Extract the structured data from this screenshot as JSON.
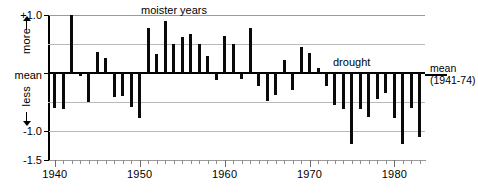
{
  "chart_data": {
    "type": "bar",
    "title": "",
    "subtitle": "",
    "xlabel": "",
    "ylabel": "",
    "xlim": [
      1939.2,
      1983.6
    ],
    "ylim": [
      -1.5,
      1.0
    ],
    "grid": true,
    "gridlines_y": [
      1.0,
      0.5,
      0.0,
      -0.5,
      -1.0,
      -1.5
    ],
    "legend": "none",
    "y_tick_labels": [
      "+1.0",
      "-1.0",
      "-1.5"
    ],
    "y_tick_values": [
      1.0,
      -1.0,
      -1.5
    ],
    "y_zero_label": "mean",
    "y_direction_labels": {
      "up": "more",
      "down": "less"
    },
    "x_tick_labels": [
      "1940",
      "1950",
      "1960",
      "1970",
      "1980"
    ],
    "x_tick_values": [
      1940,
      1950,
      1960,
      1970,
      1980
    ],
    "x_minor_tick_step": 1,
    "annotations": [
      {
        "text": "moister years",
        "x": 1951,
        "y": 1.02
      },
      {
        "text": "drought",
        "x": 1974,
        "y": 0.15
      },
      {
        "text": "mean",
        "x": 1984.5,
        "y": 0.09
      },
      {
        "text": "(1941-74)",
        "x": 1984.5,
        "y": -0.03
      }
    ],
    "bar_color": "#0a0a0a",
    "categories": [
      1940,
      1941,
      1942,
      1943,
      1944,
      1945,
      1946,
      1947,
      1948,
      1949,
      1950,
      1951,
      1952,
      1953,
      1954,
      1955,
      1956,
      1957,
      1958,
      1959,
      1960,
      1961,
      1962,
      1963,
      1964,
      1965,
      1966,
      1967,
      1968,
      1969,
      1970,
      1971,
      1972,
      1973,
      1974,
      1975,
      1976,
      1977,
      1978,
      1979,
      1980,
      1981,
      1982,
      1983
    ],
    "values": [
      -0.6,
      -0.62,
      1.0,
      -0.05,
      -0.5,
      0.36,
      0.26,
      -0.42,
      -0.4,
      -0.58,
      -0.78,
      0.77,
      0.32,
      0.9,
      0.5,
      0.62,
      0.68,
      0.5,
      0.3,
      -0.12,
      0.64,
      0.5,
      -0.1,
      0.78,
      -0.22,
      -0.48,
      -0.38,
      0.22,
      -0.3,
      0.45,
      0.34,
      0.08,
      -0.22,
      -0.56,
      -0.62,
      -1.22,
      -0.62,
      -0.76,
      -0.44,
      -0.34,
      -0.78,
      -1.22,
      -0.6,
      -1.1
    ]
  },
  "axis": {
    "y_top_label": "+1.0",
    "y_mean_label": "mean",
    "y_neg1_label": "-1.0",
    "y_neg15_label": "-1.5",
    "more_label": "more",
    "less_label": "less",
    "x_labels": [
      "1940",
      "1950",
      "1960",
      "1970",
      "1980"
    ]
  },
  "annotations": {
    "moister": "moister years",
    "drought": "drought",
    "mean_right_line1": "mean",
    "mean_right_line2": "(1941-74)"
  }
}
